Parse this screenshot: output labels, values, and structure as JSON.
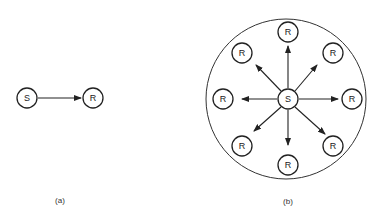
{
  "diagrams": {
    "a": {
      "caption": "(a)",
      "source": {
        "label": "S",
        "x": 27,
        "y": 98
      },
      "receiver": {
        "label": "R",
        "x": 93,
        "y": 98
      }
    },
    "b": {
      "caption": "(b)",
      "boundary": {
        "cx": 286,
        "cy": 99,
        "r": 80
      },
      "source": {
        "label": "S",
        "x": 288,
        "y": 99
      },
      "receivers": [
        {
          "label": "R",
          "x": 288,
          "y": 32
        },
        {
          "label": "R",
          "x": 333,
          "y": 53
        },
        {
          "label": "R",
          "x": 352,
          "y": 99
        },
        {
          "label": "R",
          "x": 333,
          "y": 146
        },
        {
          "label": "R",
          "x": 288,
          "y": 165
        },
        {
          "label": "R",
          "x": 242,
          "y": 146
        },
        {
          "label": "R",
          "x": 223,
          "y": 99
        },
        {
          "label": "R",
          "x": 242,
          "y": 53
        }
      ]
    }
  },
  "colors": {
    "stroke": "#222222",
    "background": "#ffffff"
  }
}
